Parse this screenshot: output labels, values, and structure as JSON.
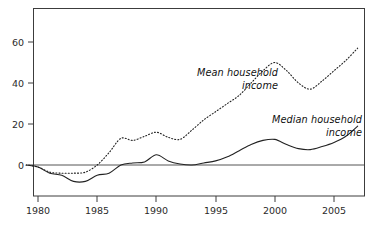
{
  "chart_data": {
    "type": "line",
    "title": "",
    "subtitle": "",
    "xlabel": "",
    "ylabel": "",
    "xlim": [
      1979,
      2008
    ],
    "ylim": [
      -20,
      70
    ],
    "grid": false,
    "legend_position": "inline-annotation",
    "yticks": [
      0,
      20,
      40,
      60
    ],
    "ytick_labels": [
      "0",
      "20",
      "40",
      "60"
    ],
    "xticks": [
      1980,
      1985,
      1990,
      1995,
      2000,
      2005
    ],
    "xtick_labels": [
      "1980",
      "1985",
      "1990",
      "1995",
      "2000",
      "2005"
    ],
    "zero_line": 0,
    "x": [
      1979,
      1980,
      1981,
      1982,
      1983,
      1984,
      1985,
      1986,
      1987,
      1988,
      1989,
      1990,
      1991,
      1992,
      1993,
      1994,
      1995,
      1996,
      1997,
      1998,
      1999,
      2000,
      2001,
      2002,
      2003,
      2004,
      2005,
      2006,
      2007
    ],
    "series": [
      {
        "name": "Mean household income",
        "style": "dotted",
        "color": "#222222",
        "values": [
          0,
          -1,
          -3.5,
          -4,
          -4,
          -3.5,
          0,
          6,
          13,
          12,
          14,
          16,
          13.5,
          12.5,
          17,
          22,
          26,
          30,
          34,
          40,
          46,
          50,
          46,
          40,
          37,
          41,
          46,
          51,
          57
        ]
      },
      {
        "name": "Median household income",
        "style": "solid",
        "color": "#222222",
        "values": [
          0,
          -1,
          -4,
          -5,
          -8,
          -8,
          -5,
          -4,
          0,
          1,
          1.5,
          5,
          2,
          0.5,
          0,
          1,
          2,
          4,
          7,
          10,
          12,
          12.5,
          10,
          8,
          7.5,
          9,
          11,
          14,
          19
        ]
      }
    ],
    "annotations": [
      {
        "id": "mean-label",
        "text_line1": "Mean household",
        "text_line2": "income"
      },
      {
        "id": "median-label",
        "text_line1": "Median household",
        "text_line2": "income"
      }
    ]
  },
  "axes": {
    "frame_color": "#3c3c3c"
  }
}
